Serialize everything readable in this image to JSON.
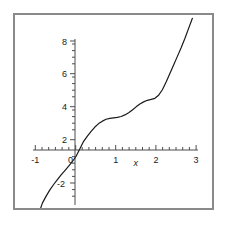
{
  "figure": {
    "background_color": "#ffffff",
    "frame_color": "#8a8a8a",
    "curve_color": "#1a1a1a",
    "axis_color": "#4d4d4d",
    "text_color": "#1a1a1a"
  },
  "chart_data": {
    "type": "line",
    "title": "",
    "subtitle": "",
    "xlabel": "x",
    "ylabel": "",
    "xlim": [
      -1.25,
      3.15
    ],
    "ylim": [
      -4.2,
      9.0
    ],
    "xticks": [
      -1,
      0,
      1,
      2,
      3
    ],
    "yticks": [
      -2,
      0,
      2,
      4,
      6,
      8
    ],
    "xticklabels": [
      "-1",
      "0",
      "1",
      "2",
      "3"
    ],
    "yticklabels": [
      "-2",
      "0",
      "2",
      "4",
      "6",
      "8"
    ],
    "minor_ticks": true,
    "grid": false,
    "legend": null,
    "annotations": [],
    "axis_style": "centered-cross",
    "series": [
      {
        "name": "curve",
        "x": [
          -1.05,
          -1.0,
          -0.9,
          -0.8,
          -0.7,
          -0.6,
          -0.5,
          -0.4,
          -0.3,
          -0.2,
          -0.1,
          0.0,
          0.1,
          0.2,
          0.3,
          0.4,
          0.5,
          0.6,
          0.7,
          0.8,
          0.9,
          1.0,
          1.1,
          1.2,
          1.3,
          1.4,
          1.5,
          1.6,
          1.7,
          1.8,
          1.9,
          2.0,
          2.1,
          2.2,
          2.3,
          2.4,
          2.5,
          2.6,
          2.7,
          2.8,
          2.9,
          3.0
        ],
        "y": [
          -3.85,
          -3.5,
          -3.05,
          -2.65,
          -2.3,
          -1.98,
          -1.68,
          -1.4,
          -1.12,
          -0.82,
          -0.48,
          0.0,
          0.48,
          0.82,
          1.12,
          1.4,
          1.62,
          1.78,
          1.9,
          1.96,
          1.99,
          2.02,
          2.08,
          2.18,
          2.32,
          2.5,
          2.7,
          2.88,
          3.02,
          3.12,
          3.18,
          3.25,
          3.45,
          3.8,
          4.3,
          4.85,
          5.4,
          5.95,
          6.5,
          7.1,
          7.75,
          8.4
        ]
      }
    ]
  },
  "x_axis_label": "x",
  "tick_labels": {
    "x": [
      "-1",
      "0",
      "1",
      "2",
      "3"
    ],
    "y": [
      "-2",
      "2",
      "4",
      "6",
      "8"
    ]
  }
}
